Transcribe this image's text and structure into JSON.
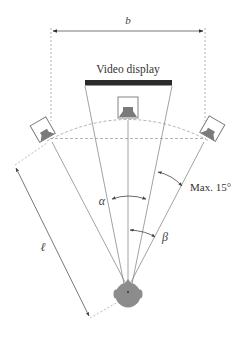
{
  "diagram": {
    "labels": {
      "speaker_base_width": "b",
      "video_display": "Video display",
      "alpha": "α",
      "beta": "β",
      "listening_distance": "ℓ",
      "max_angle": "Max. 15°"
    },
    "elements": {
      "left_speaker": "Left loudspeaker (angled toward listener)",
      "center_speaker": "Center loudspeaker (below display)",
      "right_speaker": "Right loudspeaker (angled toward listener)",
      "listener": "Listener head (top view)",
      "display": "Video display screen"
    },
    "colors": {
      "line": "#8a8a8a",
      "dashed": "#a0a0a0",
      "display_bar": "#2b2b2b",
      "speaker_fill": "#7a7a7a",
      "head_fill": "#8c8c8c",
      "text": "#333333"
    }
  }
}
